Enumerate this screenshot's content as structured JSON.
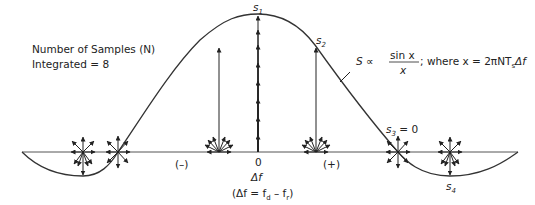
{
  "legend": {
    "line1": "Number of Samples (N)",
    "line2": "Integrated = 8"
  },
  "formula": {
    "lhs": "S ∝",
    "numerator": "sin x",
    "denominator": "x",
    "rest": "; where x = 2πNT",
    "sub": "s",
    "tail": "Δf"
  },
  "labels": {
    "s1": "s",
    "s1_sub": "1",
    "s2": "s",
    "s2_sub": "2",
    "s3": "s",
    "s3_sub": "3",
    "s3_eq": " = 0",
    "s4": "s",
    "s4_sub": "4",
    "zero": "0",
    "minus": "(–)",
    "plus": "(+)",
    "delta_f": "Δf",
    "definition": "(Δf = f",
    "def_sub1": "d",
    "def_mid": " – f",
    "def_sub2": "r",
    "def_end": ")"
  },
  "diagram": {
    "n_samples": 8,
    "function": "sinc",
    "points": [
      {
        "name": "s1",
        "position": "peak"
      },
      {
        "name": "s2",
        "position": "right-slope"
      },
      {
        "name": "s3",
        "position": "first-null",
        "value": 0
      },
      {
        "name": "s4",
        "position": "sidelobe"
      }
    ]
  }
}
